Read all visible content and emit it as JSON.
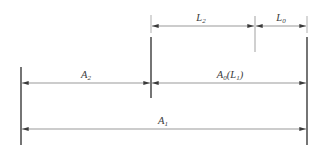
{
  "diagram": {
    "type": "dimension-chain",
    "colors": {
      "background": "#ffffff",
      "line": "#3a3a3a",
      "text": "#3a3a3a"
    },
    "labels": {
      "L2": {
        "base": "L",
        "sub": "2"
      },
      "L0": {
        "base": "L",
        "sub": "0"
      },
      "A2": {
        "base": "A",
        "sub": "2"
      },
      "A0L1": {
        "base": "A",
        "sub": "0",
        "rest": "(L",
        "sub2": "1",
        "close": ")"
      },
      "A1": {
        "base": "A",
        "sub": "1"
      }
    },
    "datums": [
      {
        "id": "left",
        "x": 21,
        "y1": 67,
        "y2": 145,
        "weight": "thick"
      },
      {
        "id": "middle",
        "x": 151,
        "y1": 37,
        "y2": 98,
        "weight": "thick",
        "extension": {
          "y1": 15,
          "y2": 33
        }
      },
      {
        "id": "middle-right",
        "x": 255,
        "y1": 16,
        "y2": 52,
        "weight": "thin"
      },
      {
        "id": "right",
        "x": 307,
        "y1": 37,
        "y2": 145,
        "weight": "thick",
        "extension": {
          "y1": 16,
          "y2": 33
        }
      }
    ],
    "dimensions": [
      {
        "label": "L2",
        "x1": 151,
        "x2": 255,
        "y": 26
      },
      {
        "label": "L0",
        "x1": 255,
        "x2": 307,
        "y": 26
      },
      {
        "label": "A2",
        "x1": 21,
        "x2": 151,
        "y": 83
      },
      {
        "label": "A0(L1)",
        "x1": 151,
        "x2": 307,
        "y": 83
      },
      {
        "label": "A1",
        "x1": 21,
        "x2": 307,
        "y": 129
      }
    ]
  }
}
